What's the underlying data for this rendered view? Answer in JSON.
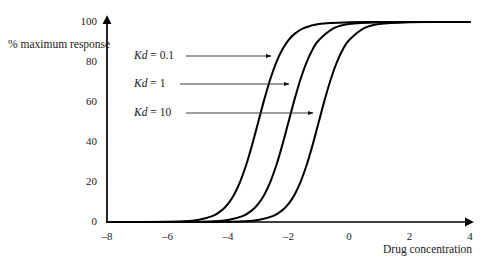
{
  "figure": {
    "background": "#ffffff",
    "line_color": "#000000",
    "annotation_color": "#3d3d3d"
  },
  "chart_data": {
    "type": "line",
    "title": "",
    "subtitle": "",
    "xlabel": "Drug concentration",
    "ylabel": "% maximum response",
    "xlim": [
      -8,
      4
    ],
    "ylim": [
      0,
      100
    ],
    "xticks": [
      -8,
      -6,
      -4,
      -2,
      0,
      2,
      4
    ],
    "xtick_labels": [
      "–8",
      "–6",
      "–4",
      "–2",
      "0",
      "2",
      "4"
    ],
    "yticks": [
      0,
      20,
      40,
      60,
      80,
      100
    ],
    "ytick_labels": [
      "0",
      "20",
      "40",
      "60",
      "80",
      "100"
    ],
    "grid": false,
    "legend_position": "inside-upper-left",
    "axis_style": "arrow-ended",
    "curve_model": "sigmoid: y = 100 / (1 + 10^(ec50 - x))",
    "series": [
      {
        "name": "Kd = 0.1",
        "label_prefix": "Kd",
        "label_value": "= 0.1",
        "ec50": -3,
        "color": "#000000",
        "x": [
          -8,
          -7,
          -6,
          -5.5,
          -5,
          -4.5,
          -4.2,
          -4,
          -3.8,
          -3.6,
          -3.4,
          -3.2,
          -3,
          -2.8,
          -2.6,
          -2.4,
          -2.2,
          -2,
          -1.8,
          -1.5,
          -1,
          0,
          1,
          2,
          3,
          4
        ],
        "y": [
          0,
          0.01,
          0.1,
          0.32,
          1,
          3.07,
          5.93,
          9.09,
          13.66,
          20.07,
          28.47,
          38.69,
          50,
          61.31,
          71.53,
          79.93,
          86.34,
          90.91,
          94.07,
          96.93,
          99,
          99.9,
          99.99,
          100,
          100,
          100
        ]
      },
      {
        "name": "Kd = 1",
        "label_prefix": "Kd",
        "label_value": "= 1",
        "ec50": -2,
        "color": "#000000",
        "x": [
          -8,
          -7,
          -6,
          -5,
          -4.5,
          -4,
          -3.5,
          -3.2,
          -3,
          -2.8,
          -2.6,
          -2.4,
          -2.2,
          -2,
          -1.8,
          -1.6,
          -1.4,
          -1.2,
          -1,
          -0.5,
          0,
          1,
          2,
          3,
          4
        ],
        "y": [
          0,
          0,
          0.01,
          0.1,
          0.32,
          1,
          3.07,
          5.93,
          9.09,
          13.66,
          20.07,
          28.47,
          38.69,
          50,
          61.31,
          71.53,
          79.93,
          86.34,
          90.91,
          96.93,
          99,
          99.9,
          99.99,
          100,
          100
        ]
      },
      {
        "name": "Kd = 10",
        "label_prefix": "Kd",
        "label_value": "= 10",
        "ec50": -1,
        "color": "#000000",
        "x": [
          -8,
          -7,
          -6,
          -5,
          -4,
          -3.5,
          -3,
          -2.5,
          -2.2,
          -2,
          -1.8,
          -1.6,
          -1.4,
          -1.2,
          -1,
          -0.8,
          -0.6,
          -0.4,
          -0.2,
          0,
          0.5,
          1,
          2,
          3,
          4
        ],
        "y": [
          0,
          0,
          0,
          0.01,
          0.1,
          0.32,
          1,
          3.07,
          5.93,
          9.09,
          13.66,
          20.07,
          28.47,
          38.69,
          50,
          61.31,
          71.53,
          79.93,
          86.34,
          90.91,
          96.93,
          99,
          99.9,
          99.99,
          100
        ]
      }
    ],
    "annotations": [
      {
        "text_prefix": "Kd",
        "text_value": "= 0.1",
        "points_to": "Kd = 0.1 curve",
        "at_y_percent": 82
      },
      {
        "text_prefix": "Kd",
        "text_value": "= 1",
        "points_to": "Kd = 1 curve",
        "at_y_percent": 69
      },
      {
        "text_prefix": "Kd",
        "text_value": "= 10",
        "points_to": "Kd = 10 curve",
        "at_y_percent": 56
      }
    ]
  }
}
